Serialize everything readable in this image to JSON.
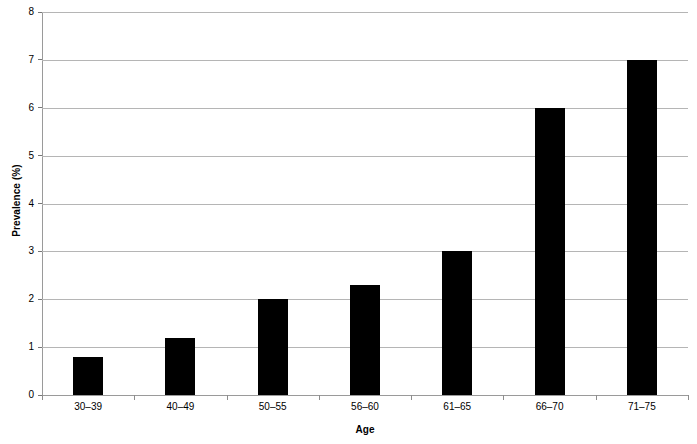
{
  "chart_data": {
    "type": "bar",
    "title": "",
    "subtitle": "",
    "xlabel": "Age",
    "ylabel": "Prevalence (%)",
    "categories": [
      "30–39",
      "40–49",
      "50–55",
      "56–60",
      "61–65",
      "66–70",
      "71–75"
    ],
    "values": [
      0.8,
      1.2,
      2.0,
      2.3,
      3.0,
      6.0,
      7.0
    ],
    "ylim": [
      0,
      8
    ],
    "ytick_labels": [
      "0",
      "1",
      "2",
      "3",
      "4",
      "5",
      "6",
      "7",
      "8"
    ],
    "ytick_values": [
      0,
      1,
      2,
      3,
      4,
      5,
      6,
      7,
      8
    ],
    "grid": "horizontal",
    "legend": "none",
    "bar_color": "#000000",
    "gridline_color": "#b5b5b5",
    "axis_color": "#9a9a9a",
    "background_color": "#ffffff"
  }
}
